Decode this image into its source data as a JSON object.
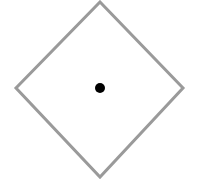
{
  "canvas": {
    "width": 202,
    "height": 184,
    "background_color": "#ffffff",
    "title": "Diamond outline with center point"
  },
  "shapes": {
    "diamond": {
      "name": "diamond-outline",
      "type": "rhombus",
      "points": "100,2 183,88 100,177 16,88",
      "vertices": {
        "top": {
          "x": 100,
          "y": 2
        },
        "right": {
          "x": 183,
          "y": 88
        },
        "bottom": {
          "x": 100,
          "y": 177
        },
        "left": {
          "x": 16,
          "y": 88
        }
      },
      "stroke_color": "#9a9a9a",
      "stroke_width": 3,
      "fill_color": "none",
      "width": 167,
      "height": 175
    },
    "center_dot": {
      "name": "center-point",
      "type": "circle",
      "cx": 100,
      "cy": 88,
      "r": 5,
      "diameter": 10,
      "fill_color": "#000000",
      "stroke_color": "none"
    }
  }
}
